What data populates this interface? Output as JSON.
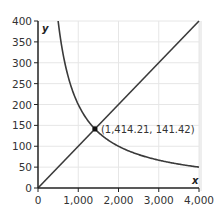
{
  "chart_data": {
    "type": "line",
    "title": "",
    "xlabel": "x",
    "ylabel": "y",
    "xlim": [
      0,
      4000
    ],
    "ylim": [
      0,
      400
    ],
    "xticks": [
      0,
      1000,
      2000,
      3000,
      4000
    ],
    "xtick_labels": [
      "0",
      "1,000",
      "2,000",
      "3,000",
      "4,000"
    ],
    "yticks": [
      0,
      50,
      100,
      150,
      200,
      250,
      300,
      350,
      400
    ],
    "ytick_labels": [
      "0",
      "50",
      "100",
      "150",
      "200",
      "250",
      "300",
      "350",
      "400"
    ],
    "grid": true,
    "series": [
      {
        "name": "y = x/10",
        "type": "line",
        "x": [
          0,
          4000
        ],
        "y": [
          0,
          400
        ]
      },
      {
        "name": "y = 200000/x",
        "type": "curve",
        "x": [
          500,
          1000,
          1414.21,
          2000,
          3000,
          4000
        ],
        "y": [
          400,
          200,
          141.42,
          100,
          66.67,
          50
        ]
      }
    ],
    "annotations": [
      {
        "x": 1414.21,
        "y": 141.42,
        "label": "(1,414.21, 141.42)"
      }
    ]
  },
  "colors": {
    "line": "#3a3a3a",
    "grid": "#e6e6e6",
    "axis": "#222222"
  }
}
